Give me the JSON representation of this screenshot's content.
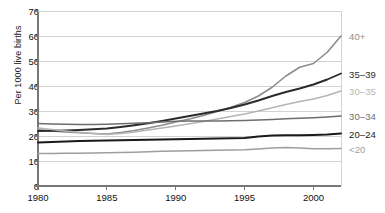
{
  "chart_data": {
    "type": "line",
    "title": "",
    "xlabel": "",
    "ylabel": "Per 1000 live births",
    "xlim": [
      1980,
      2002
    ],
    "ylim": [
      0,
      70
    ],
    "yticks": [
      0,
      10,
      20,
      30,
      40,
      50,
      60,
      70
    ],
    "xticks": [
      1980,
      1985,
      1990,
      1995,
      2000
    ],
    "grid": "horizontal",
    "legend_position": "right-inline",
    "x": [
      1980,
      1981,
      1982,
      1983,
      1984,
      1985,
      1986,
      1987,
      1988,
      1989,
      1990,
      1991,
      1992,
      1993,
      1994,
      1995,
      1996,
      1997,
      1998,
      1999,
      2000,
      2001,
      2002
    ],
    "series": [
      {
        "name": "40+",
        "label": "40+",
        "color": "#8c8c8c",
        "width": 1.6,
        "values": [
          22.5,
          22.0,
          21.6,
          21.3,
          21.0,
          20.8,
          21.4,
          22.2,
          23.2,
          24.3,
          25.6,
          26.8,
          28.2,
          29.8,
          31.5,
          33.4,
          36.0,
          39.5,
          44.0,
          47.5,
          49.0,
          53.5,
          60.0
        ]
      },
      {
        "name": "35-39",
        "label": "35–39",
        "color": "#2b2b2b",
        "width": 1.9,
        "values": [
          22.0,
          22.1,
          22.2,
          22.4,
          22.7,
          23.0,
          23.6,
          24.3,
          25.1,
          26.0,
          27.0,
          28.0,
          29.0,
          30.0,
          31.2,
          32.6,
          34.2,
          36.0,
          37.6,
          39.0,
          40.6,
          42.6,
          45.0
        ]
      },
      {
        "name": "30-35",
        "label": "30–35",
        "color": "#b5b5b5",
        "width": 1.6,
        "values": [
          23.2,
          22.6,
          22.0,
          21.5,
          21.0,
          20.6,
          21.0,
          21.6,
          22.4,
          23.2,
          24.0,
          24.9,
          25.8,
          26.8,
          27.8,
          28.8,
          30.0,
          31.3,
          32.6,
          33.8,
          34.8,
          36.2,
          38.0
        ]
      },
      {
        "name": "30-34",
        "label": "30–34",
        "color": "#6e6e6e",
        "width": 1.7,
        "values": [
          25.0,
          24.8,
          24.7,
          24.6,
          24.6,
          24.7,
          24.9,
          25.1,
          25.3,
          25.6,
          25.9,
          26.0,
          26.0,
          26.0,
          26.1,
          26.2,
          26.4,
          26.6,
          26.9,
          27.1,
          27.3,
          27.6,
          28.0
        ]
      },
      {
        "name": "20-24",
        "label": "20–24",
        "color": "#1a1a1a",
        "width": 2.0,
        "values": [
          17.4,
          17.6,
          17.8,
          18.0,
          18.1,
          18.2,
          18.3,
          18.4,
          18.5,
          18.6,
          18.7,
          18.8,
          18.9,
          19.0,
          19.1,
          19.2,
          19.8,
          20.2,
          20.3,
          20.3,
          20.4,
          20.6,
          21.0
        ]
      },
      {
        "name": "<20",
        "label": "<20",
        "color": "#9e9e9e",
        "width": 1.5,
        "values": [
          13.0,
          13.0,
          13.1,
          13.1,
          13.2,
          13.3,
          13.4,
          13.5,
          13.7,
          13.9,
          14.0,
          14.1,
          14.2,
          14.3,
          14.4,
          14.5,
          14.8,
          15.2,
          15.4,
          15.2,
          14.9,
          14.9,
          15.0
        ]
      }
    ],
    "axis_color": "#888888",
    "grid_color": "#d2d2d2",
    "background": "#ffffff"
  }
}
